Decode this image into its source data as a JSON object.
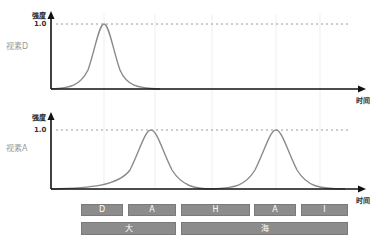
{
  "top_chart": {
    "y_axis_label": "强度",
    "y_tick": "1.0",
    "row_label": "视素D",
    "x_axis_label": "时间"
  },
  "bottom_chart": {
    "y_axis_label": "强度",
    "y_tick": "1.0",
    "row_label": "视素A",
    "x_axis_label": "时间"
  },
  "phoneme_row": [
    {
      "label": "D",
      "x": 81,
      "w": 42
    },
    {
      "label": "A",
      "x": 128,
      "w": 48
    },
    {
      "label": "H",
      "x": 181,
      "w": 69
    },
    {
      "label": "A",
      "x": 254,
      "w": 42
    },
    {
      "label": "I",
      "x": 301,
      "w": 47
    }
  ],
  "word_row": [
    {
      "label": "大",
      "x": 81,
      "w": 95
    },
    {
      "label": "海",
      "x": 181,
      "w": 167
    }
  ],
  "colors": {
    "curve": "#8a8a8a",
    "axis": "#111111",
    "box": "#8c8c8c",
    "dotted": "#9a9a9a"
  }
}
